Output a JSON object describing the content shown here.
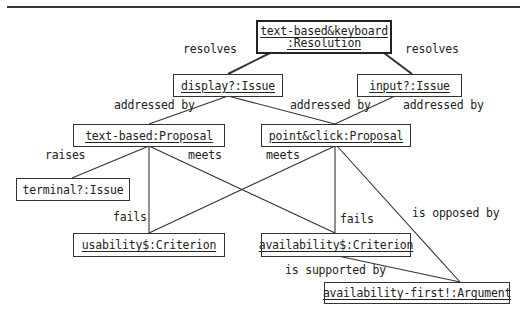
{
  "diagram": {
    "type": "argumentation-graph",
    "nodes": [
      {
        "id": "resolution",
        "line1": "text-based&keyboard",
        "line2": ":Resolution",
        "underlined": true
      },
      {
        "id": "display_issue",
        "label": "display?:Issue",
        "underlined": true
      },
      {
        "id": "input_issue",
        "label": "input?:Issue",
        "underlined": true
      },
      {
        "id": "text_proposal",
        "label": "text-based:Proposal",
        "underlined": true
      },
      {
        "id": "point_proposal",
        "label": "point&click:Proposal",
        "underlined": true
      },
      {
        "id": "terminal_issue",
        "label": "terminal?:Issue",
        "underlined": false
      },
      {
        "id": "usability_criterion",
        "label": "usability$:Criterion",
        "underlined": true
      },
      {
        "id": "availability_criterion",
        "label": "availability$:Criterion",
        "underlined": true
      },
      {
        "id": "argument",
        "label": "availability-first!:Argument",
        "underlined": true
      }
    ],
    "edges": [
      {
        "from": "resolution",
        "to": "display_issue",
        "label": "resolves"
      },
      {
        "from": "resolution",
        "to": "input_issue",
        "label": "resolves"
      },
      {
        "from": "display_issue",
        "to": "text_proposal",
        "label": "addressed by"
      },
      {
        "from": "display_issue",
        "to": "point_proposal",
        "label": "addressed by"
      },
      {
        "from": "input_issue",
        "to": "point_proposal",
        "label": "addressed by"
      },
      {
        "from": "text_proposal",
        "to": "terminal_issue",
        "label": "raises"
      },
      {
        "from": "text_proposal",
        "to": "usability_criterion",
        "label": "fails"
      },
      {
        "from": "text_proposal",
        "to": "availability_criterion",
        "label": "meets"
      },
      {
        "from": "point_proposal",
        "to": "usability_criterion",
        "label": "meets"
      },
      {
        "from": "point_proposal",
        "to": "availability_criterion",
        "label": "fails"
      },
      {
        "from": "point_proposal",
        "to": "argument",
        "label": "is opposed by"
      },
      {
        "from": "availability_criterion",
        "to": "argument",
        "label": "is supported by"
      }
    ],
    "edge_labels": {
      "resolves_left": "resolves",
      "resolves_right": "resolves",
      "addressed_by_1": "addressed by",
      "addressed_by_2": "addressed by",
      "addressed_by_3": "addressed by",
      "raises": "raises",
      "meets_1": "meets",
      "meets_2": "meets",
      "fails_1": "fails",
      "fails_2": "fails",
      "is_opposed_by": "is opposed by",
      "is_supported_by": "is supported by"
    }
  }
}
